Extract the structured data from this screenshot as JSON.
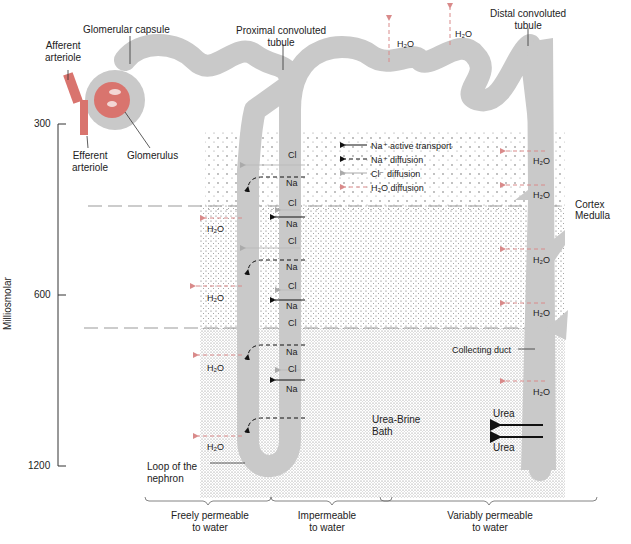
{
  "labels": {
    "glomerular_capsule": "Glomerular capsule",
    "afferent_arteriole": [
      "Afferent",
      "arteriole"
    ],
    "efferent_arteriole": [
      "Efferent",
      "arteriole"
    ],
    "glomerulus": "Glomerulus",
    "proximal_tubule": [
      "Proximal convoluted",
      "tubule"
    ],
    "distal_tubule": [
      "Distal convoluted",
      "tubule"
    ],
    "cortex": "Cortex",
    "medulla": "Medulla",
    "collecting_duct": "Collecting duct",
    "bath": [
      "Urea-Brine",
      "Bath"
    ],
    "loop": [
      "Loop of the",
      "nephron"
    ],
    "urea": "Urea",
    "h2o": "H₂O",
    "na": "Na",
    "cl": "Cl"
  },
  "axis": {
    "title": "Milliosmolar",
    "ticks": [
      {
        "label": "300",
        "y": 124
      },
      {
        "label": "600",
        "y": 295
      },
      {
        "label": "1200",
        "y": 466
      }
    ]
  },
  "legend": [
    {
      "label": "Na⁺ active transport",
      "style": "solid-black"
    },
    {
      "label": "Na⁺ diffusion",
      "style": "dashed-black"
    },
    {
      "label": "Cl⁻ diffusion",
      "style": "solid-gray"
    },
    {
      "label": "H₂O diffusion",
      "style": "dashed-pink"
    }
  ],
  "permeability": [
    {
      "line1": "Freely permeable",
      "line2": "to water"
    },
    {
      "line1": "Impermeable",
      "line2": "to water"
    },
    {
      "line1": "Variably permeable",
      "line2": "to water"
    }
  ],
  "ascending_ions": [
    "Cl",
    "Na",
    "Cl",
    "Na",
    "Cl",
    "Na",
    "Cl",
    "Na",
    "Cl",
    "Na",
    "Cl",
    "Na"
  ],
  "colors": {
    "tubule": "#c9c9c9",
    "vessel": "#d9746e",
    "h2o_arrow": "#d98a8a",
    "dashline": "#999999"
  }
}
